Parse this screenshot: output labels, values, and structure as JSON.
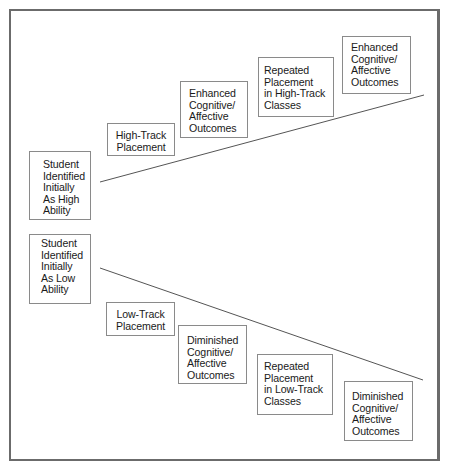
{
  "diagram": {
    "type": "tracking-flow",
    "high_path": {
      "start": {
        "lines": [
          "Student",
          "Identified",
          "Initially",
          "As High",
          "Ability"
        ]
      },
      "steps": [
        {
          "lines": [
            "High-Track",
            "Placement"
          ]
        },
        {
          "lines": [
            "Enhanced",
            "Cognitive/",
            "Affective",
            "Outcomes"
          ]
        },
        {
          "lines": [
            "Repeated",
            "Placement",
            "in High-Track",
            "Classes"
          ]
        },
        {
          "lines": [
            "Enhanced",
            "Cognitive/",
            "Affective",
            "Outcomes"
          ]
        }
      ],
      "trend": "upward"
    },
    "low_path": {
      "start": {
        "lines": [
          "Student",
          "Identified",
          "Initially",
          "As Low",
          "Ability"
        ]
      },
      "steps": [
        {
          "lines": [
            "Low-Track",
            "Placement"
          ]
        },
        {
          "lines": [
            "Diminished",
            "Cognitive/",
            "Affective",
            "Outcomes"
          ]
        },
        {
          "lines": [
            "Repeated",
            "Placement",
            "in Low-Track",
            "Classes"
          ]
        },
        {
          "lines": [
            "Diminished",
            "Cognitive/",
            "Affective",
            "Outcomes"
          ]
        }
      ],
      "trend": "downward"
    },
    "colors": {
      "border": "#8a8a8a",
      "frame": "#6b6b6b",
      "line": "#555555",
      "text": "#1a1a1a"
    }
  }
}
